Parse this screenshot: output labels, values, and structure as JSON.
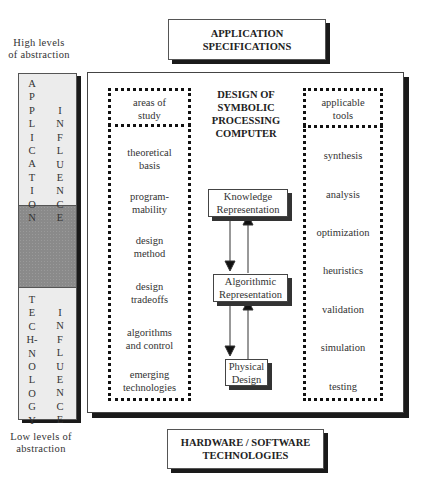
{
  "labels": {
    "high_abstraction": [
      "High levels",
      "of abstraction"
    ],
    "low_abstraction": [
      "Low levels of",
      "abstraction"
    ]
  },
  "top_box": {
    "line1": "APPLICATION",
    "line2": "SPECIFICATIONS"
  },
  "bottom_box": {
    "line1": "HARDWARE / SOFTWARE",
    "line2": "TECHNOLOGIES"
  },
  "left_column": {
    "top_word_1": [
      "A",
      "P",
      "P",
      "L",
      "I",
      "C",
      "A",
      "T",
      "I",
      "O",
      "N"
    ],
    "top_word_2": [
      "I",
      "N",
      "F",
      "L",
      "U",
      "E",
      "N",
      "C",
      "E"
    ],
    "bottom_word_1": [
      "T",
      "E",
      "C",
      "H-",
      "N",
      "O",
      "L",
      "O",
      "G",
      "Y"
    ],
    "bottom_word_2": [
      "I",
      "N",
      "F",
      "L",
      "U",
      "E",
      "N",
      "C",
      "E"
    ],
    "colors": {
      "panel": "#ececec",
      "shaded": "#8a8a8a"
    }
  },
  "main": {
    "title": [
      "DESIGN OF",
      "SYMBOLIC",
      "PROCESSING",
      "COMPUTER"
    ],
    "left_panel": {
      "header": [
        "areas of",
        "study"
      ],
      "items": [
        [
          "theoretical",
          "basis"
        ],
        [
          "program-",
          "mability"
        ],
        [
          "design",
          "method"
        ],
        [
          "design",
          "tradeoffs"
        ],
        [
          "algorithms",
          "and control"
        ],
        [
          "emerging",
          "technologies"
        ]
      ]
    },
    "right_panel": {
      "header": [
        "applicable",
        "tools"
      ],
      "items": [
        "synthesis",
        "analysis",
        "optimization",
        "heuristics",
        "validation",
        "simulation",
        "testing"
      ]
    },
    "flow": [
      {
        "line1": "Knowledge",
        "line2": "Representation"
      },
      {
        "line1": "Algorithmic",
        "line2": "Representation"
      },
      {
        "line1": "Physical",
        "line2": "Design"
      }
    ]
  }
}
